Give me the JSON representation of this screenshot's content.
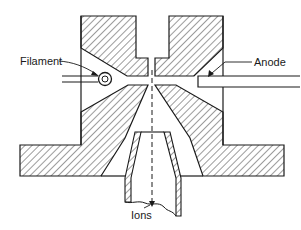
{
  "diagram": {
    "labels": {
      "filament": "Filament",
      "anode": "Anode",
      "ions": "Ions"
    },
    "colors": {
      "stroke": "#1a1a1a",
      "hatch": "#3a3a3a",
      "background": "#ffffff"
    }
  }
}
